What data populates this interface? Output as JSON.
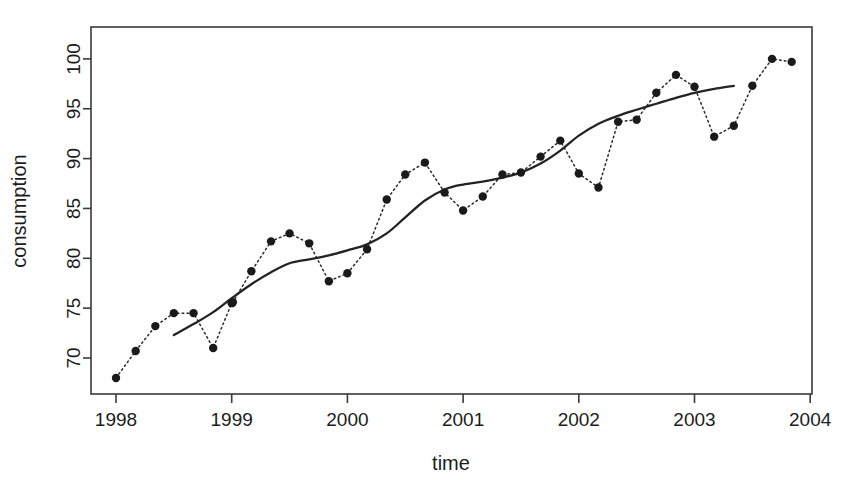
{
  "chart_data": {
    "type": "scatter",
    "title": "",
    "xlabel": "time",
    "ylabel": "consumption",
    "xlim": [
      1997.82,
      11904.0
    ],
    "x_axis_range": [
      1997.82,
      2004.12
    ],
    "ylim": [
      67.0,
      101.6
    ],
    "grid": false,
    "legend": null,
    "xticks": [
      1998,
      1999,
      2000,
      2001,
      2002,
      2003,
      2004
    ],
    "xtick_labels": [
      "1998",
      "1999",
      "2000",
      "2001",
      "2002",
      "2003",
      "2004"
    ],
    "yticks": [
      70,
      75,
      80,
      85,
      90,
      95,
      100
    ],
    "ytick_labels": [
      "70",
      "75",
      "80",
      "85",
      "90",
      "95",
      "100"
    ],
    "series": [
      {
        "name": "consumption",
        "style": "dotted-line-with-points",
        "marker": "filled-circle",
        "x": [
          1998.0,
          1998.17,
          1998.34,
          1998.5,
          1998.67,
          1998.84,
          1999.0,
          1999.01,
          1999.17,
          1999.34,
          1999.5,
          1999.67,
          1999.84,
          2000.0,
          2000.17,
          2000.34,
          2000.5,
          2000.67,
          2000.84,
          2001.0,
          2001.17,
          2001.34,
          2001.5,
          2001.67,
          2001.84,
          2002.0,
          2002.17,
          2002.34,
          2002.5,
          2002.67,
          2002.84,
          2003.0,
          2003.17,
          2003.34,
          2003.5,
          2003.67,
          2003.84
        ],
        "y": [
          68.0,
          70.7,
          73.2,
          74.5,
          74.5,
          71.0,
          75.5,
          75.6,
          78.7,
          81.7,
          82.5,
          81.5,
          77.7,
          78.5,
          80.9,
          85.9,
          88.4,
          89.6,
          86.6,
          84.8,
          86.2,
          88.4,
          88.6,
          90.2,
          91.8,
          88.5,
          87.1,
          93.7,
          93.9,
          96.6,
          98.4,
          97.2,
          92.2,
          93.3,
          97.3,
          100.0,
          99.7
        ]
      },
      {
        "name": "smoothed trend",
        "style": "solid-line",
        "x": [
          1998.5,
          1998.67,
          1998.84,
          1999.0,
          1999.17,
          1999.34,
          1999.5,
          1999.67,
          1999.84,
          2000.0,
          2000.17,
          2000.34,
          2000.5,
          2000.67,
          2000.84,
          2001.0,
          2001.17,
          2001.34,
          2001.5,
          2001.67,
          2001.84,
          2002.0,
          2002.17,
          2002.34,
          2002.5,
          2002.67,
          2002.84,
          2003.0,
          2003.17,
          2003.34
        ],
        "y": [
          72.3,
          73.4,
          74.6,
          76.0,
          77.4,
          78.6,
          79.5,
          79.9,
          80.3,
          80.8,
          81.4,
          82.5,
          84.1,
          85.8,
          86.9,
          87.4,
          87.7,
          88.1,
          88.6,
          89.5,
          90.8,
          92.3,
          93.5,
          94.3,
          94.9,
          95.5,
          96.1,
          96.6,
          97.0,
          97.3
        ]
      }
    ],
    "points_table": {
      "columns": [
        "time",
        "consumption"
      ],
      "rows": [
        [
          "1998.00",
          "68.0"
        ],
        [
          "1998.17",
          "70.7"
        ],
        [
          "1998.34",
          "73.2"
        ],
        [
          "1998.50",
          "74.5"
        ],
        [
          "1998.67",
          "74.5"
        ],
        [
          "1998.84",
          "71.0"
        ],
        [
          "1999.00",
          "75.5"
        ],
        [
          "1999.17",
          "78.7"
        ],
        [
          "1999.34",
          "81.7"
        ],
        [
          "1999.50",
          "82.5"
        ],
        [
          "1999.67",
          "81.5"
        ],
        [
          "1999.84",
          "77.7"
        ],
        [
          "2000.00",
          "78.5"
        ],
        [
          "2000.17",
          "80.9"
        ],
        [
          "2000.34",
          "85.9"
        ],
        [
          "2000.50",
          "88.4"
        ],
        [
          "2000.67",
          "89.6"
        ],
        [
          "2000.84",
          "86.6"
        ],
        [
          "2001.00",
          "84.8"
        ],
        [
          "2001.17",
          "86.2"
        ],
        [
          "2001.34",
          "88.4"
        ],
        [
          "2001.50",
          "90.2"
        ],
        [
          "2001.67",
          "91.8"
        ],
        [
          "2001.84",
          "88.5"
        ],
        [
          "2002.00",
          "87.1"
        ],
        [
          "2002.17",
          "93.7"
        ],
        [
          "2002.34",
          "96.6"
        ],
        [
          "2002.50",
          "98.4"
        ],
        [
          "2002.67",
          "97.2"
        ],
        [
          "2002.84",
          "92.2"
        ],
        [
          "2003.00",
          "93.3"
        ],
        [
          "2003.17",
          "97.3"
        ],
        [
          "2003.34",
          "100.0"
        ],
        [
          "2003.50",
          "99.7"
        ],
        [
          "2003.67",
          "100.2"
        ],
        [
          "2003.84",
          "93.3"
        ]
      ]
    }
  },
  "axes": {
    "x_title": "time",
    "y_title": "consumption"
  }
}
